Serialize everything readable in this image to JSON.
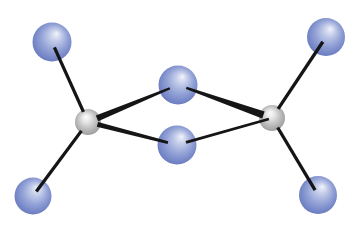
{
  "figure": {
    "type": "molecule",
    "canvas": {
      "width": 361,
      "height": 229,
      "background": "#ffffff"
    },
    "palette": {
      "blue_sphere": {
        "highlight": "#f2f4fb",
        "light": "#c3cce9",
        "mid": "#93a2d6",
        "base": "#6e7fc3",
        "edge": "#4e5dab"
      },
      "gray_sphere": {
        "highlight": "#fcfcfc",
        "light": "#e8e8e8",
        "mid": "#c2c2c2",
        "base": "#a0a0a0",
        "edge": "#8b8b8b"
      },
      "bond": "#151515"
    },
    "atoms": [
      {
        "id": "M1",
        "name": "metal-atom-left",
        "kind": "gray",
        "x": 88,
        "y": 122,
        "r": 13
      },
      {
        "id": "M2",
        "name": "metal-atom-right",
        "kind": "gray",
        "x": 272,
        "y": 118,
        "r": 13
      },
      {
        "id": "B1",
        "name": "bridging-atom-top",
        "kind": "blue",
        "x": 178,
        "y": 85,
        "r": 19.5
      },
      {
        "id": "B2",
        "name": "bridging-atom-bottom",
        "kind": "blue",
        "x": 177,
        "y": 145,
        "r": 19.5
      },
      {
        "id": "T1",
        "name": "terminal-atom-top-left",
        "kind": "blue",
        "x": 52,
        "y": 42,
        "r": 19.5
      },
      {
        "id": "T2",
        "name": "terminal-atom-bottom-left",
        "kind": "blue",
        "x": 33,
        "y": 196,
        "r": 18.5
      },
      {
        "id": "T3",
        "name": "terminal-atom-top-right",
        "kind": "blue",
        "x": 326,
        "y": 37,
        "r": 19
      },
      {
        "id": "T4",
        "name": "terminal-atom-bottom-right",
        "kind": "blue",
        "x": 318,
        "y": 195,
        "r": 19
      }
    ],
    "bonds": [
      {
        "from": "T1",
        "to": "M1",
        "w_from": 3.3,
        "w_to": 3.3,
        "trim_from": 0.3,
        "trim_to": 0.85
      },
      {
        "from": "T2",
        "to": "M1",
        "w_from": 3.3,
        "w_to": 3.3,
        "trim_from": 0.3,
        "trim_to": 0.85
      },
      {
        "from": "T3",
        "to": "M2",
        "w_from": 3.3,
        "w_to": 3.3,
        "trim_from": 0.3,
        "trim_to": 0.85
      },
      {
        "from": "T4",
        "to": "M2",
        "w_from": 3.3,
        "w_to": 3.3,
        "trim_from": 0.3,
        "trim_to": 0.85
      },
      {
        "from": "M1",
        "to": "B1",
        "w_from": 6.2,
        "w_to": 2.2,
        "trim_from": 0.75,
        "trim_to": 0.45
      },
      {
        "from": "M1",
        "to": "B2",
        "w_from": 4.8,
        "w_to": 2.8,
        "trim_from": 0.75,
        "trim_to": 0.48
      },
      {
        "from": "B1",
        "to": "M2",
        "w_from": 2.2,
        "w_to": 7.3,
        "trim_from": 0.45,
        "trim_to": 0.7
      },
      {
        "from": "B2",
        "to": "M2",
        "w_from": 2.9,
        "w_to": 2.6,
        "trim_from": 0.48,
        "trim_to": 0.25
      }
    ]
  }
}
